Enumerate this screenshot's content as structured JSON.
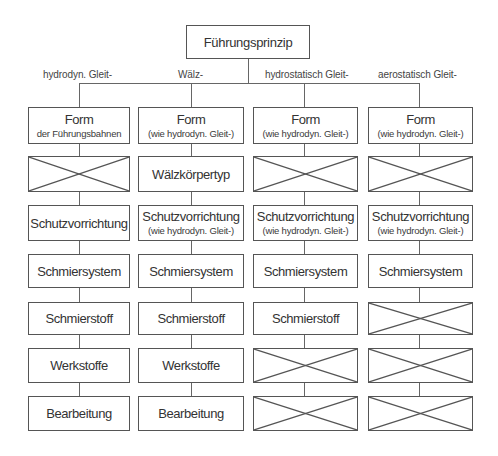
{
  "root": {
    "label": "Führungsprinzip"
  },
  "branches": [
    {
      "label": "hydrodyn. Gleit-"
    },
    {
      "label": "Wälz-"
    },
    {
      "label": "hydrostatisch Gleit-"
    },
    {
      "label": "aerostatisch Gleit-"
    }
  ],
  "columns": [
    {
      "cells": [
        {
          "main": "Form",
          "sub": "der Führungsbahnen"
        },
        {
          "crossed": true
        },
        {
          "main": "Schutzvorrichtung"
        },
        {
          "main": "Schmiersystem"
        },
        {
          "main": "Schmierstoff"
        },
        {
          "main": "Werkstoffe"
        },
        {
          "main": "Bearbeitung"
        }
      ]
    },
    {
      "cells": [
        {
          "main": "Form",
          "sub": "(wie hydrodyn. Gleit-)"
        },
        {
          "main": "Wälzkörpertyp"
        },
        {
          "main": "Schutzvorrichtung",
          "sub": "(wie hydrodyn. Gleit-)"
        },
        {
          "main": "Schmiersystem"
        },
        {
          "main": "Schmierstoff"
        },
        {
          "main": "Werkstoffe"
        },
        {
          "main": "Bearbeitung"
        }
      ]
    },
    {
      "cells": [
        {
          "main": "Form",
          "sub": "(wie hydrodyn. Gleit-)"
        },
        {
          "crossed": true
        },
        {
          "main": "Schutzvorrichtung",
          "sub": "(wie hydrodyn. Gleit-)"
        },
        {
          "main": "Schmiersystem"
        },
        {
          "main": "Schmierstoff"
        },
        {
          "crossed": true
        },
        {
          "crossed": true
        }
      ]
    },
    {
      "cells": [
        {
          "main": "Form",
          "sub": "(wie hydrodyn. Gleit-)"
        },
        {
          "crossed": true
        },
        {
          "main": "Schutzvorrichtung",
          "sub": "(wie hydrodyn. Gleit-)"
        },
        {
          "main": "Schmiersystem"
        },
        {
          "crossed": true
        },
        {
          "crossed": true
        },
        {
          "crossed": true
        }
      ]
    }
  ],
  "colors": {
    "line": "#555555",
    "text": "#333333",
    "background": "#ffffff"
  }
}
